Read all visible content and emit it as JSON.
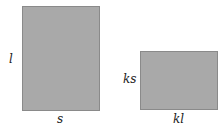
{
  "diagram": {
    "rect_original": {
      "height_label": "l",
      "width_label": "s",
      "fill": "#a9a9a9"
    },
    "rect_scaled": {
      "height_label": "ks",
      "width_label": "kl",
      "fill": "#a9a9a9"
    }
  }
}
